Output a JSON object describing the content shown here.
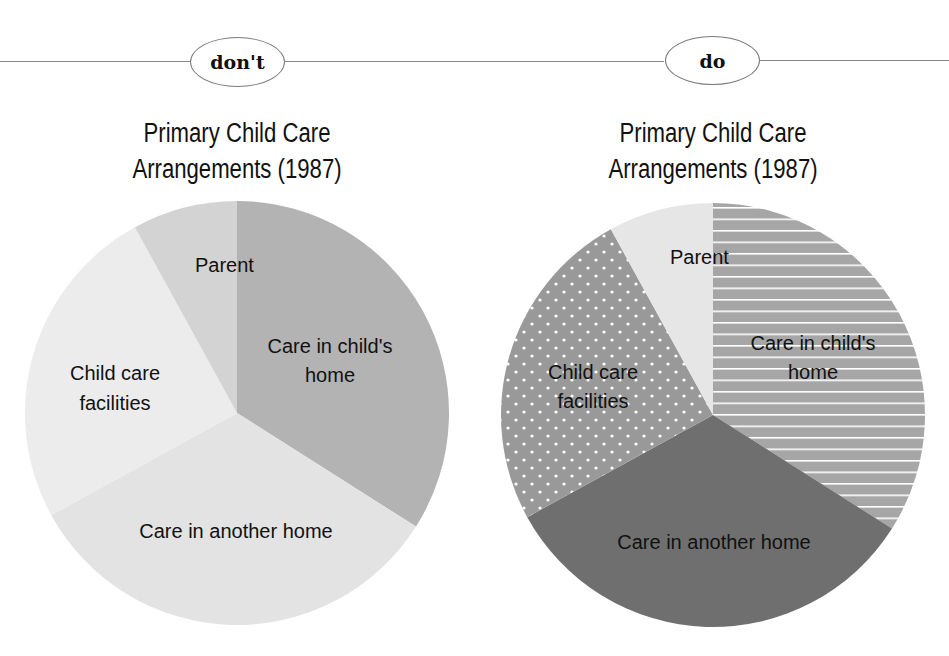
{
  "panels": [
    {
      "badge": "don't",
      "title_lines": [
        "Primary Child Care",
        "Arrangements (1987)"
      ],
      "style": "low-contrast grays"
    },
    {
      "badge": "do",
      "title_lines": [
        "Primary Child Care",
        "Arrangements (1987)"
      ],
      "style": "contrasting fills and patterns"
    }
  ],
  "labels": {
    "parent": "Parent",
    "child_home_1": "Care in child's",
    "child_home_2": "home",
    "facilities_1": "Child care",
    "facilities_2": "facilities",
    "another_home": "Care in another home"
  },
  "colors": {
    "dont": {
      "child_home": "#b3b3b3",
      "another_home": "#e3e3e3",
      "facilities": "#ececec",
      "parent": "#d3d3d3"
    },
    "do": {
      "child_home": "#a6a6a6",
      "another_home": "#6f6f6f",
      "facilities": "#999999",
      "parent": "#e6e6e6"
    }
  },
  "chart_data": [
    {
      "type": "pie",
      "title": "Primary Child Care Arrangements (1987)",
      "panel_label": "don't",
      "categories": [
        "Care in child's home",
        "Care in another home",
        "Child care facilities",
        "Parent"
      ],
      "values": [
        34,
        33,
        25,
        8
      ],
      "start_angle": "12 o'clock, clockwise",
      "legend": "none (direct labels)"
    },
    {
      "type": "pie",
      "title": "Primary Child Care Arrangements (1987)",
      "panel_label": "do",
      "categories": [
        "Care in child's home",
        "Care in another home",
        "Child care facilities",
        "Parent"
      ],
      "values": [
        34,
        33,
        25,
        8
      ],
      "start_angle": "12 o'clock, clockwise",
      "legend": "none (direct labels)"
    }
  ]
}
